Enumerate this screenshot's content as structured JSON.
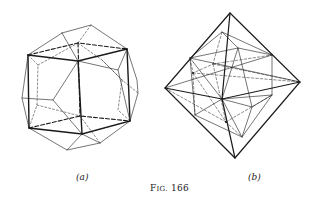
{
  "figure": {
    "caption_prefix": "F",
    "caption_small": "IG.",
    "caption_number": "166",
    "caption": "Fig. 166",
    "panels": [
      {
        "id": "a",
        "label": "(a)",
        "description": "Rhombic dodecahedron-like polyhedron with inscribed cube (heavy edges) and hidden edges dashed"
      },
      {
        "id": "b",
        "label": "(b)",
        "description": "Octahedron with inscribed polyhedron, hidden edges dashed"
      }
    ]
  },
  "colors": {
    "ink": "#1a1a1a",
    "background": "#ffffff"
  }
}
